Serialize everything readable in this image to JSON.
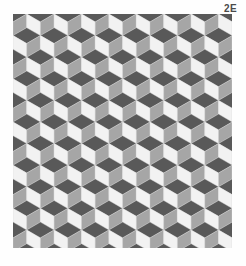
{
  "figure": {
    "label": "2E",
    "title": "2E",
    "background_color": "#fefefe"
  },
  "pattern": {
    "name": "tumbling-blocks-isometric-cube-tessellation",
    "description": "Isometric cube (tumbling block) tessellation rendered in three gray tones",
    "origin_x": 13,
    "origin_y": 14,
    "width": 219,
    "height": 234,
    "cube_width": 27.4,
    "cube_half_width": 13.7,
    "cube_top_height": 7.9,
    "cube_side_height": 13.7,
    "row_period": 21.6,
    "columns": 9,
    "rows": 12,
    "faces": {
      "top": {
        "name": "top-face",
        "color": "#595959"
      },
      "left": {
        "name": "left-face",
        "color": "#f2f2f2"
      },
      "right": {
        "name": "right-face",
        "color": "#a6a6a6"
      }
    },
    "stroke_color": "#d8d8d8",
    "stroke_width": 0.35
  }
}
